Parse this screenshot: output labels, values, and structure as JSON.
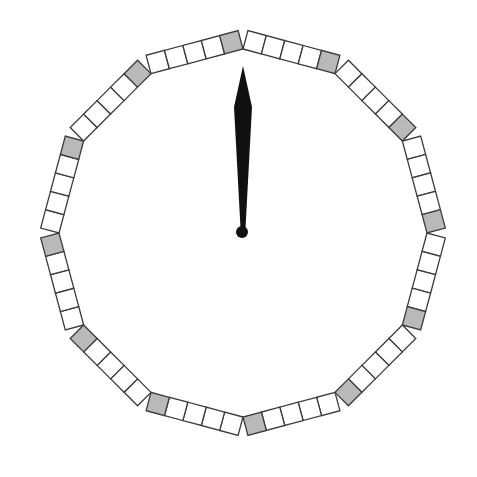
{
  "diagram": {
    "type": "clock-dial",
    "center": [
      243,
      233
    ],
    "inner_radius": 184,
    "sides": 12,
    "cells_per_side": 5,
    "cell_depth": 19,
    "marked_cell_position": "clockwise-end",
    "colors": {
      "background": "#ffffff",
      "cell_fill": "#ffffff",
      "marked_fill": "#b9b9b9",
      "stroke": "#3a3a3a",
      "hand": "#111111"
    },
    "hand": {
      "angle_deg": 0,
      "tip_length": 166,
      "widest_at": 125,
      "widest_half_width": 9,
      "base_half_width": 2.5,
      "pivot_radius": 6
    },
    "segments": [
      {
        "index": 0,
        "from_deg": 0,
        "to_deg": 30,
        "cells": [
          "empty",
          "empty",
          "empty",
          "empty",
          "marked"
        ]
      },
      {
        "index": 1,
        "from_deg": 30,
        "to_deg": 60,
        "cells": [
          "empty",
          "empty",
          "empty",
          "empty",
          "marked"
        ]
      },
      {
        "index": 2,
        "from_deg": 60,
        "to_deg": 90,
        "cells": [
          "empty",
          "empty",
          "empty",
          "empty",
          "marked"
        ]
      },
      {
        "index": 3,
        "from_deg": 90,
        "to_deg": 120,
        "cells": [
          "empty",
          "empty",
          "empty",
          "empty",
          "marked"
        ]
      },
      {
        "index": 4,
        "from_deg": 120,
        "to_deg": 150,
        "cells": [
          "empty",
          "empty",
          "empty",
          "empty",
          "marked"
        ]
      },
      {
        "index": 5,
        "from_deg": 150,
        "to_deg": 180,
        "cells": [
          "empty",
          "empty",
          "empty",
          "empty",
          "marked"
        ]
      },
      {
        "index": 6,
        "from_deg": 180,
        "to_deg": 210,
        "cells": [
          "empty",
          "empty",
          "empty",
          "empty",
          "marked"
        ]
      },
      {
        "index": 7,
        "from_deg": 210,
        "to_deg": 240,
        "cells": [
          "empty",
          "empty",
          "empty",
          "empty",
          "marked"
        ]
      },
      {
        "index": 8,
        "from_deg": 240,
        "to_deg": 270,
        "cells": [
          "empty",
          "empty",
          "empty",
          "empty",
          "marked"
        ]
      },
      {
        "index": 9,
        "from_deg": 270,
        "to_deg": 300,
        "cells": [
          "empty",
          "empty",
          "empty",
          "empty",
          "marked"
        ]
      },
      {
        "index": 10,
        "from_deg": 300,
        "to_deg": 330,
        "cells": [
          "empty",
          "empty",
          "empty",
          "empty",
          "marked"
        ]
      },
      {
        "index": 11,
        "from_deg": 330,
        "to_deg": 360,
        "cells": [
          "empty",
          "empty",
          "empty",
          "empty",
          "marked"
        ]
      }
    ]
  }
}
